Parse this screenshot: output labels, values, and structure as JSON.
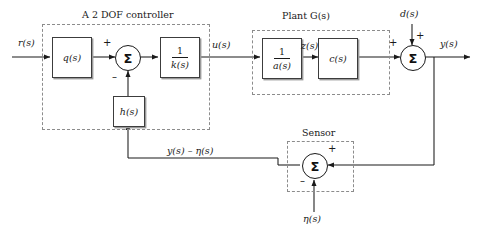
{
  "diagram": {
    "groups": {
      "controller": {
        "title_prefix": "A 2 DOF controller",
        "title": "A 2 DOF controller"
      },
      "plant": {
        "title_prefix": "Plant ",
        "title_var": "G(s)",
        "title": "Plant G(s)"
      },
      "sensor": {
        "title": "Sensor"
      }
    },
    "blocks": {
      "q": "q(s)",
      "k_num": "1",
      "k_den": "k(s)",
      "k_label": "1/k(s)",
      "h": "h(s)",
      "a_num": "1",
      "a_den": "a(s)",
      "a_label": "1/a(s)",
      "c": "c(s)"
    },
    "signals": {
      "r": "r(s)",
      "u": "u(s)",
      "z": "z(s)",
      "d": "d(s)",
      "y": "y(s)",
      "eta": "η(s)",
      "feedback": "y(s) – η(s)"
    },
    "signs": {
      "sum1_plus": "+",
      "sum1_minus": "–",
      "sum2_left_plus": "+",
      "sum2_top_plus": "+",
      "sum3_right_plus": "+",
      "sum3_bottom_minus": "–"
    },
    "sum_symbol": "Σ",
    "colors": {
      "line": "#1a1a1a",
      "block_border": "#3c3c3c",
      "block_shadow": "#9a9a9a",
      "dashed_border": "#8c8c8c",
      "background": "#ffffff"
    }
  }
}
